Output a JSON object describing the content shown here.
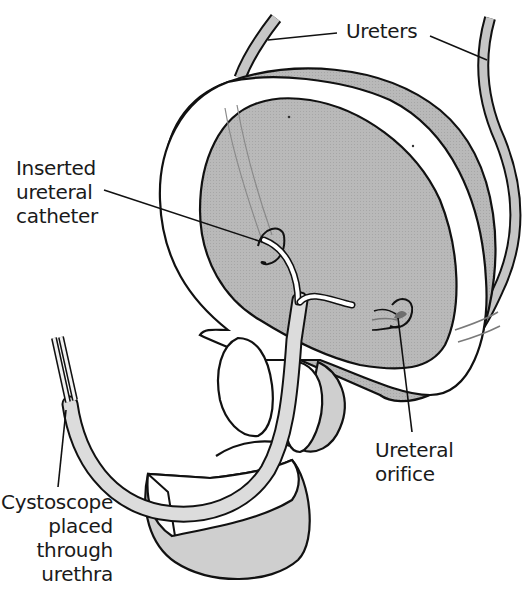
{
  "diagram": {
    "type": "anatomical illustration",
    "colors": {
      "outline": "#111111",
      "tissue_fill": "#b4b4b4",
      "light_fill": "#d8d8d8",
      "background": "#ffffff",
      "catheter": "#ffffff",
      "orifice": "#6e6e6e"
    }
  },
  "labels": {
    "ureters": {
      "text": "Ureters"
    },
    "catheter": {
      "lines": [
        "Inserted",
        "ureteral",
        "catheter"
      ]
    },
    "orifice": {
      "lines": [
        "Ureteral",
        "orifice"
      ]
    },
    "cystoscope": {
      "lines": [
        "Cystoscope",
        "placed",
        "through",
        "urethra"
      ]
    }
  }
}
